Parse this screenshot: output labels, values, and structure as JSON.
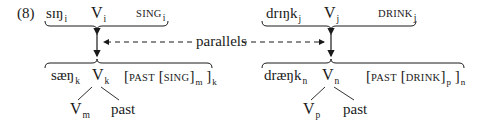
{
  "example": {
    "number": "(8)",
    "label_parallels": "parallels",
    "left": {
      "top": {
        "form": "sɪŋ",
        "form_index": "i",
        "v": "V",
        "v_index": "i",
        "gloss": "SING",
        "gloss_index": "i"
      },
      "bottom": {
        "form": "sæŋ",
        "form_index": "k",
        "v": "V",
        "v_index": "k",
        "bracket_open": "[",
        "past": "PAST",
        "inner_open": "[",
        "inner": "SING",
        "inner_close": "]",
        "inner_index": "m",
        "bracket_close": "]",
        "outer_index": "k"
      },
      "children": {
        "v": "V",
        "v_index": "m",
        "past": "past"
      }
    },
    "right": {
      "top": {
        "form": "drɪŋk",
        "form_index": "j",
        "v": "V",
        "v_index": "j",
        "gloss": "DRINK",
        "gloss_index": "j"
      },
      "bottom": {
        "form": "dræŋk",
        "form_index": "n",
        "v": "V",
        "v_index": "n",
        "bracket_open": "[",
        "past": "PAST",
        "inner_open": "[",
        "inner": "DRINK",
        "inner_close": "]",
        "inner_index": "p",
        "bracket_close": "]",
        "outer_index": "n"
      },
      "children": {
        "v": "V",
        "v_index": "p",
        "past": "past"
      }
    },
    "colors": {
      "ink": "#1a1a1a",
      "background": "#ffffff"
    }
  }
}
